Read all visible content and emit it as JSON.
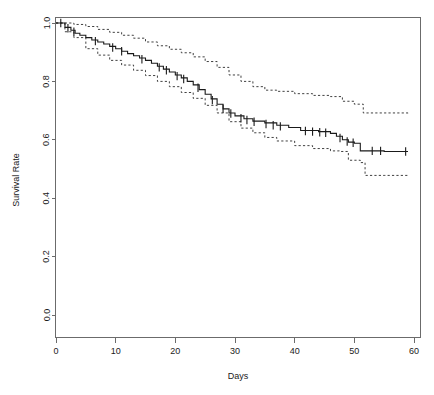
{
  "chart_data": {
    "type": "line",
    "title": "",
    "subtitle": "",
    "xlabel": "Days",
    "ylabel": "Survival Rate",
    "xlim": [
      0,
      60
    ],
    "ylim": [
      0.0,
      1.0
    ],
    "grid": false,
    "legend": "none",
    "x_ticks": [
      0,
      10,
      20,
      30,
      40,
      50,
      60
    ],
    "x_tick_labels": [
      "0",
      "10",
      "20",
      "30",
      "40",
      "50",
      "60"
    ],
    "y_ticks": [
      0.0,
      0.2,
      0.4,
      0.6,
      0.8,
      1.0
    ],
    "y_tick_labels": [
      "0.0",
      "0.2",
      "0.4",
      "0.6",
      "0.8",
      "1.0"
    ],
    "style": "kaplan-meier step function with 95% confidence bands and censoring marks",
    "series": [
      {
        "name": "Survival estimate",
        "line_style": "solid",
        "x": [
          0,
          1.5,
          2.5,
          3.2,
          4.0,
          5.0,
          6.0,
          7.0,
          8.0,
          9.0,
          10.0,
          11.0,
          12.0,
          13.0,
          14.0,
          15.0,
          16.0,
          17.0,
          18.0,
          19.0,
          20.0,
          21.0,
          22.0,
          23.0,
          24.0,
          25.0,
          26.0,
          27.0,
          28.0,
          29.0,
          30.0,
          31.5,
          33.0,
          35.0,
          37.0,
          39.0,
          41.0,
          44.0,
          46.0,
          47.0,
          48.0,
          49.0,
          50.0,
          51.0,
          52.0,
          55.0,
          59.0
        ],
        "y": [
          1.0,
          0.985,
          0.975,
          0.965,
          0.958,
          0.95,
          0.942,
          0.935,
          0.928,
          0.92,
          0.912,
          0.903,
          0.895,
          0.888,
          0.88,
          0.872,
          0.862,
          0.852,
          0.842,
          0.832,
          0.822,
          0.812,
          0.8,
          0.788,
          0.772,
          0.756,
          0.74,
          0.722,
          0.706,
          0.692,
          0.682,
          0.672,
          0.664,
          0.658,
          0.65,
          0.642,
          0.632,
          0.628,
          0.622,
          0.612,
          0.6,
          0.592,
          0.588,
          0.562,
          0.562,
          0.56,
          0.56
        ]
      },
      {
        "name": "Upper 95% confidence limit",
        "line_style": "dashed",
        "x": [
          0,
          1.5,
          3.0,
          5.0,
          7.0,
          9.0,
          11.0,
          13.0,
          15.0,
          17.0,
          19.0,
          21.0,
          23.0,
          25.0,
          27.0,
          29.0,
          31.0,
          33.0,
          35.0,
          37.0,
          40.0,
          43.0,
          46.0,
          48.0,
          50.0,
          51.5,
          55.0,
          59.0
        ],
        "y": [
          1.0,
          1.0,
          0.995,
          0.988,
          0.978,
          0.968,
          0.958,
          0.948,
          0.935,
          0.922,
          0.91,
          0.898,
          0.884,
          0.868,
          0.848,
          0.822,
          0.8,
          0.782,
          0.77,
          0.766,
          0.758,
          0.752,
          0.748,
          0.732,
          0.722,
          0.692,
          0.692,
          0.69
        ]
      },
      {
        "name": "Lower 95% confidence limit",
        "line_style": "dashed",
        "x": [
          0,
          1.5,
          3.0,
          5.0,
          7.0,
          9.0,
          11.0,
          13.0,
          15.0,
          17.0,
          19.0,
          21.0,
          23.0,
          25.0,
          27.0,
          29.0,
          31.0,
          33.0,
          35.0,
          37.0,
          40.0,
          43.0,
          46.0,
          47.5,
          49.0,
          51.0,
          51.8,
          55.0,
          59.0
        ],
        "y": [
          1.0,
          0.97,
          0.95,
          0.912,
          0.89,
          0.872,
          0.856,
          0.838,
          0.82,
          0.8,
          0.782,
          0.762,
          0.742,
          0.718,
          0.692,
          0.662,
          0.64,
          0.624,
          0.608,
          0.596,
          0.58,
          0.57,
          0.562,
          0.56,
          0.53,
          0.522,
          0.478,
          0.478,
          0.476
        ]
      }
    ],
    "censoring_marks": [
      {
        "x": 0.8,
        "y": 1.0
      },
      {
        "x": 2.0,
        "y": 0.982
      },
      {
        "x": 3.0,
        "y": 0.97
      },
      {
        "x": 6.6,
        "y": 0.938
      },
      {
        "x": 9.5,
        "y": 0.916
      },
      {
        "x": 11.0,
        "y": 0.903
      },
      {
        "x": 14.4,
        "y": 0.876
      },
      {
        "x": 17.3,
        "y": 0.848
      },
      {
        "x": 18.5,
        "y": 0.838
      },
      {
        "x": 20.3,
        "y": 0.818
      },
      {
        "x": 21.4,
        "y": 0.808
      },
      {
        "x": 23.8,
        "y": 0.778
      },
      {
        "x": 26.2,
        "y": 0.736
      },
      {
        "x": 28.0,
        "y": 0.706
      },
      {
        "x": 29.3,
        "y": 0.69
      },
      {
        "x": 31.0,
        "y": 0.674
      },
      {
        "x": 32.0,
        "y": 0.668
      },
      {
        "x": 33.2,
        "y": 0.662
      },
      {
        "x": 35.2,
        "y": 0.654
      },
      {
        "x": 36.4,
        "y": 0.65
      },
      {
        "x": 37.6,
        "y": 0.646
      },
      {
        "x": 41.8,
        "y": 0.63
      },
      {
        "x": 43.0,
        "y": 0.628
      },
      {
        "x": 44.2,
        "y": 0.626
      },
      {
        "x": 45.2,
        "y": 0.624
      },
      {
        "x": 47.6,
        "y": 0.606
      },
      {
        "x": 48.8,
        "y": 0.594
      },
      {
        "x": 49.8,
        "y": 0.59
      },
      {
        "x": 53.0,
        "y": 0.562
      },
      {
        "x": 54.4,
        "y": 0.562
      },
      {
        "x": 58.6,
        "y": 0.56
      }
    ],
    "annotations": {
      "final_survival": "0.56",
      "final_upper_ci": "0.66",
      "final_lower_ci": "0.47"
    }
  },
  "axes": {
    "x_title": "Days",
    "y_title": "Survival Rate"
  },
  "colors": {
    "line": "#1a1a1a",
    "ci": "#2b2b2b",
    "axis": "#6b6b6b",
    "background": "#ffffff",
    "text": "#1a1a1a"
  }
}
